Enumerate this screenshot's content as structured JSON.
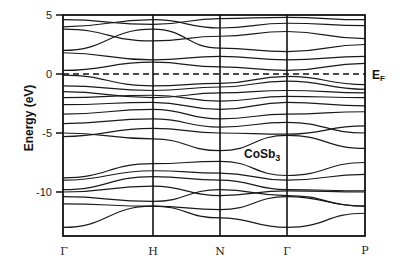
{
  "chart_data": {
    "type": "line",
    "title": "",
    "annotation": "CoSb3",
    "xlabel": "",
    "ylabel": "Energy (eV)",
    "ylim": [
      -13.7,
      5
    ],
    "yticks": [
      5,
      0,
      -5,
      -10
    ],
    "ytick_labels": [
      "5",
      "0",
      "-5",
      "-10"
    ],
    "x_kpoints": [
      "Γ",
      "H",
      "N",
      "Γ",
      "P"
    ],
    "x_kpoint_positions": [
      0,
      1,
      1.74,
      2.48,
      3.33
    ],
    "grid": false,
    "legend": null,
    "fermi_level": {
      "label": "EF",
      "energy": 0,
      "style": "dashed"
    },
    "series_description": "Electronic band structure of CoSb3 along Γ-H-N-Γ-P; dense valence bands between ~-1 and -7 eV, lower band manifold between ~-8 and -13.5 eV, conduction bands between ~0.5 and 5 eV",
    "series": [
      {
        "name": "band_low_1",
        "x": [
          0,
          1,
          1.74,
          2.48,
          3.33
        ],
        "values": [
          -13.0,
          -11.2,
          -12.2,
          -13.0,
          -11.8
        ]
      },
      {
        "name": "band_low_2",
        "x": [
          0,
          1,
          1.74,
          2.48,
          3.33
        ],
        "values": [
          -11.0,
          -11.2,
          -11.5,
          -10.4,
          -11.2
        ]
      },
      {
        "name": "band_low_3",
        "x": [
          0,
          1,
          1.74,
          2.48,
          3.33
        ],
        "values": [
          -10.4,
          -10.8,
          -9.8,
          -10.3,
          -11.2
        ]
      },
      {
        "name": "band_low_4",
        "x": [
          0,
          1,
          1.74,
          2.48,
          3.33
        ],
        "values": [
          -10.0,
          -9.5,
          -10.3,
          -9.9,
          -10.0
        ]
      },
      {
        "name": "band_low_5",
        "x": [
          0,
          1,
          1.74,
          2.48,
          3.33
        ],
        "values": [
          -9.8,
          -8.7,
          -9.0,
          -9.8,
          -9.9
        ]
      },
      {
        "name": "band_low_6",
        "x": [
          0,
          1,
          1.74,
          2.48,
          3.33
        ],
        "values": [
          -9.0,
          -8.2,
          -8.4,
          -9.0,
          -8.5
        ]
      },
      {
        "name": "band_low_7",
        "x": [
          0,
          1,
          1.74,
          2.48,
          3.33
        ],
        "values": [
          -8.8,
          -7.6,
          -7.4,
          -8.6,
          -7.5
        ]
      },
      {
        "name": "band_v_1",
        "x": [
          0,
          1,
          1.74,
          2.48,
          3.33
        ],
        "values": [
          -5.0,
          -5.5,
          -6.5,
          -5.2,
          -6.3
        ]
      },
      {
        "name": "band_v_2",
        "x": [
          0,
          1,
          1.74,
          2.48,
          3.33
        ],
        "values": [
          -5.3,
          -4.6,
          -5.0,
          -5.1,
          -4.4
        ]
      },
      {
        "name": "band_v_3",
        "x": [
          0,
          1,
          1.74,
          2.48,
          3.33
        ],
        "values": [
          -4.2,
          -3.8,
          -4.5,
          -4.1,
          -5.0
        ]
      },
      {
        "name": "band_v_4",
        "x": [
          0,
          1,
          1.74,
          2.48,
          3.33
        ],
        "values": [
          -3.4,
          -3.0,
          -3.8,
          -3.4,
          -3.2
        ]
      },
      {
        "name": "band_v_5",
        "x": [
          0,
          1,
          1.74,
          2.48,
          3.33
        ],
        "values": [
          -2.6,
          -2.4,
          -3.0,
          -2.4,
          -2.7
        ]
      },
      {
        "name": "band_v_6",
        "x": [
          0,
          1,
          1.74,
          2.48,
          3.33
        ],
        "values": [
          -2.0,
          -1.8,
          -2.3,
          -1.9,
          -2.0
        ]
      },
      {
        "name": "band_v_7",
        "x": [
          0,
          1,
          1.74,
          2.48,
          3.33
        ],
        "values": [
          -1.5,
          -2.0,
          -1.6,
          -1.4,
          -1.6
        ]
      },
      {
        "name": "band_v_8",
        "x": [
          0,
          1,
          1.74,
          2.48,
          3.33
        ],
        "values": [
          -1.0,
          -1.4,
          -1.1,
          -0.6,
          -1.3
        ]
      },
      {
        "name": "band_v_top",
        "x": [
          0,
          1,
          1.74,
          2.48,
          3.33
        ],
        "values": [
          -0.1,
          -1.0,
          -0.8,
          -0.2,
          -0.9
        ]
      },
      {
        "name": "band_c_1",
        "x": [
          0,
          1,
          1.74,
          2.48,
          3.33
        ],
        "values": [
          0.3,
          1.0,
          0.6,
          0.3,
          0.9
        ]
      },
      {
        "name": "band_c_2",
        "x": [
          0,
          1,
          1.74,
          2.48,
          3.33
        ],
        "values": [
          1.8,
          1.2,
          1.5,
          1.2,
          1.5
        ]
      },
      {
        "name": "band_c_3",
        "x": [
          0,
          1,
          1.74,
          2.48,
          3.33
        ],
        "values": [
          2.0,
          3.8,
          2.2,
          1.9,
          2.5
        ]
      },
      {
        "name": "band_c_4",
        "x": [
          0,
          1,
          1.74,
          2.48,
          3.33
        ],
        "values": [
          3.8,
          2.8,
          3.2,
          3.6,
          3.0
        ]
      },
      {
        "name": "band_c_5",
        "x": [
          0,
          1,
          1.74,
          2.48,
          3.33
        ],
        "values": [
          4.0,
          4.6,
          3.9,
          4.3,
          4.1
        ]
      },
      {
        "name": "band_c_6",
        "x": [
          0,
          1,
          1.74,
          2.48,
          3.33
        ],
        "values": [
          4.6,
          4.2,
          4.7,
          4.8,
          4.6
        ]
      }
    ]
  },
  "labels": {
    "ylabel": "Energy (eV)",
    "annotation_main": "CoSb",
    "annotation_sub": "3",
    "ef_main": "E",
    "ef_sub": "F",
    "yticks": [
      "5",
      "0",
      "-5",
      "-10"
    ],
    "kpoints": [
      "Γ",
      "H",
      "N",
      "Γ",
      "P"
    ]
  }
}
